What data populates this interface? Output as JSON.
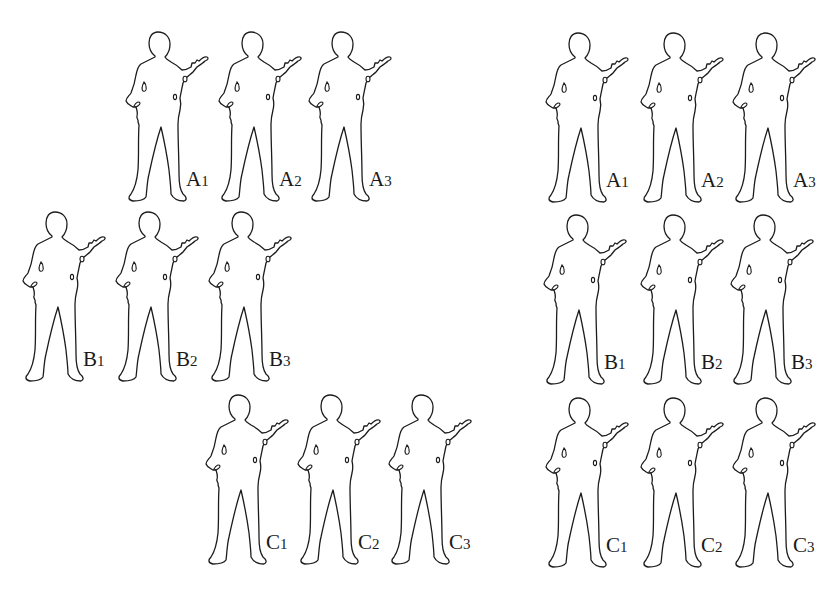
{
  "figure": {
    "colors": {
      "outline": "#1c1c1c",
      "fill": "#ffffff",
      "background": "#ffffff"
    }
  },
  "panels": [
    {
      "name": "left-formation",
      "rows": [
        {
          "row": "A",
          "soldiers": [
            {
              "letter": "A",
              "index": "1",
              "x": 125,
              "y": 30
            },
            {
              "letter": "A",
              "index": "2",
              "x": 218,
              "y": 30
            },
            {
              "letter": "A",
              "index": "3",
              "x": 308,
              "y": 30
            }
          ]
        },
        {
          "row": "B",
          "soldiers": [
            {
              "letter": "B",
              "index": "1",
              "x": 22,
              "y": 210
            },
            {
              "letter": "B",
              "index": "2",
              "x": 115,
              "y": 210
            },
            {
              "letter": "B",
              "index": "3",
              "x": 208,
              "y": 210
            }
          ]
        },
        {
          "row": "C",
          "soldiers": [
            {
              "letter": "C",
              "index": "1",
              "x": 205,
              "y": 393
            },
            {
              "letter": "C",
              "index": "2",
              "x": 297,
              "y": 393
            },
            {
              "letter": "C",
              "index": "3",
              "x": 388,
              "y": 393
            }
          ]
        }
      ]
    },
    {
      "name": "right-formation",
      "rows": [
        {
          "row": "A",
          "soldiers": [
            {
              "letter": "A",
              "index": "1",
              "x": 545,
              "y": 31
            },
            {
              "letter": "A",
              "index": "2",
              "x": 640,
              "y": 31
            },
            {
              "letter": "A",
              "index": "3",
              "x": 732,
              "y": 31
            }
          ]
        },
        {
          "row": "B",
          "soldiers": [
            {
              "letter": "B",
              "index": "1",
              "x": 543,
              "y": 213
            },
            {
              "letter": "B",
              "index": "2",
              "x": 640,
              "y": 213
            },
            {
              "letter": "B",
              "index": "3",
              "x": 730,
              "y": 213
            }
          ]
        },
        {
          "row": "C",
          "soldiers": [
            {
              "letter": "C",
              "index": "1",
              "x": 545,
              "y": 396
            },
            {
              "letter": "C",
              "index": "2",
              "x": 640,
              "y": 396
            },
            {
              "letter": "C",
              "index": "3",
              "x": 732,
              "y": 396
            }
          ]
        }
      ]
    }
  ],
  "icons": {
    "soldier": "soldier-silhouette-icon"
  }
}
